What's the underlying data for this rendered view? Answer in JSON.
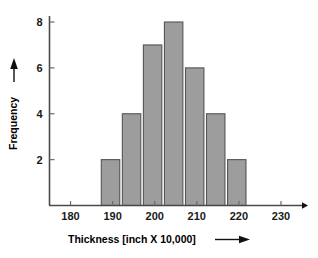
{
  "chart_data": {
    "type": "bar",
    "title": "",
    "subtitle": "",
    "xlabel": "Thickness  [inch X 10,000]",
    "ylabel": "Frequency",
    "xlim": [
      175,
      235
    ],
    "ylim": [
      0,
      8.6
    ],
    "grid": false,
    "legend": null,
    "x_ticks": [
      180,
      190,
      200,
      210,
      220,
      230
    ],
    "x_tick_labels": [
      "180",
      "190",
      "200",
      "210",
      "220",
      "230"
    ],
    "y_ticks": [
      2,
      4,
      6,
      8
    ],
    "y_tick_labels": [
      "2",
      "4",
      "6",
      "8"
    ],
    "bin_width": 5,
    "categories": [
      "187-192",
      "192-197",
      "197-202",
      "202-207",
      "207-212",
      "212-217",
      "217-222"
    ],
    "bin_edges": [
      187,
      192,
      197,
      202,
      207,
      212,
      217,
      222
    ],
    "values": [
      2,
      4,
      7,
      8,
      6,
      4,
      2
    ],
    "bar_color": "#9d9d9d",
    "bar_edge_color": "#555555",
    "axis_color": "#4a4a4a",
    "background": "#ffffff"
  },
  "axes": {
    "x_axis_arrow": "right-arrow",
    "y_axis_arrow": "up-arrow",
    "x_title_arrow": "right-arrow",
    "y_title_arrow": "up-arrow"
  }
}
